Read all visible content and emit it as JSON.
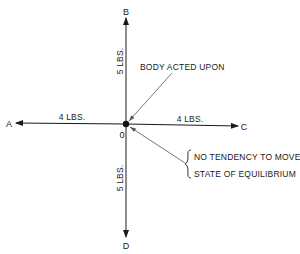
{
  "diagram": {
    "points": {
      "A": "A",
      "B": "B",
      "C": "C",
      "D": "D",
      "origin": "0"
    },
    "forces": {
      "up": "5 LBS.",
      "down": "5 LBS.",
      "left": "4 LBS.",
      "right": "4 LBS."
    },
    "annotations": {
      "body": "BODY ACTED UPON",
      "line1": "NO TENDENCY TO MOVE.",
      "line2": "STATE OF EQUILIBRIUM"
    },
    "colors": {
      "ink": "#1a1a1a",
      "background": "#ffffff"
    }
  }
}
